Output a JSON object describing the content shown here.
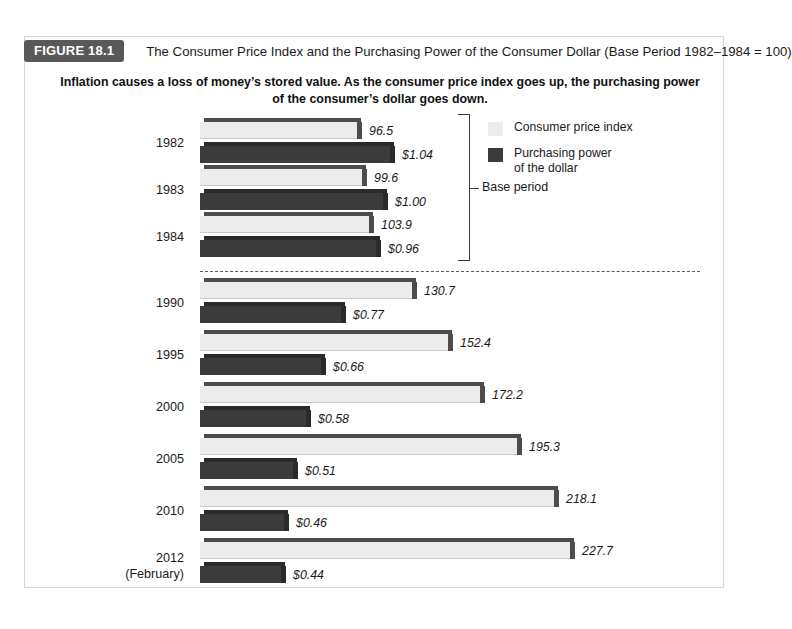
{
  "figure": {
    "tag": "FIGURE 18.1",
    "title": "The Consumer Price Index and the Purchasing Power of the Consumer Dollar (Base Period 1982–1984 = 100)",
    "subtitle": "Inflation causes a loss of money’s stored value. As the consumer price index goes up, the purchasing power of the consumer’s dollar goes down."
  },
  "legend": {
    "items": [
      {
        "label": "Consumer price index",
        "swatch": "light",
        "color": "#ececec"
      },
      {
        "label": "Purchasing power\nof the dollar",
        "swatch": "dark",
        "color": "#3b3b3b"
      }
    ]
  },
  "annotations": {
    "base_period_label": "Base period"
  },
  "chart_data": {
    "type": "bar",
    "title": "The Consumer Price Index and the Purchasing Power of the Consumer Dollar (Base Period 1982–1984 = 100)",
    "orientation": "horizontal",
    "grid": false,
    "legend_position": "top-right",
    "xlabel": "",
    "ylabel": "",
    "categories": [
      "1982",
      "1983",
      "1984",
      "1990",
      "1995",
      "2000",
      "2005",
      "2010",
      "2012 (February)"
    ],
    "category_labels": [
      {
        "line1": "1982",
        "line2": ""
      },
      {
        "line1": "1983",
        "line2": ""
      },
      {
        "line1": "1984",
        "line2": ""
      },
      {
        "line1": "1990",
        "line2": ""
      },
      {
        "line1": "1995",
        "line2": ""
      },
      {
        "line1": "2000",
        "line2": ""
      },
      {
        "line1": "2005",
        "line2": ""
      },
      {
        "line1": "2010",
        "line2": ""
      },
      {
        "line1": "2012",
        "line2": "(February)"
      }
    ],
    "series": [
      {
        "name": "Consumer price index",
        "color": "#ececec",
        "values": [
          96.5,
          99.6,
          103.9,
          130.7,
          152.4,
          172.2,
          195.3,
          218.1,
          227.7
        ],
        "labels": [
          "96.5",
          "99.6",
          "103.9",
          "130.7",
          "152.4",
          "172.2",
          "195.3",
          "218.1",
          "227.7"
        ]
      },
      {
        "name": "Purchasing power of the dollar",
        "color": "#3b3b3b",
        "values": [
          1.04,
          1.0,
          0.96,
          0.77,
          0.66,
          0.58,
          0.51,
          0.46,
          0.44
        ],
        "labels": [
          "$1.04",
          "$1.00",
          "$0.96",
          "$0.77",
          "$0.66",
          "$0.58",
          "$0.51",
          "$0.46",
          "$0.44"
        ]
      }
    ],
    "base_period": {
      "label": "Base period",
      "categories": [
        "1982",
        "1983",
        "1984"
      ]
    },
    "divider_after_category": "1984"
  }
}
